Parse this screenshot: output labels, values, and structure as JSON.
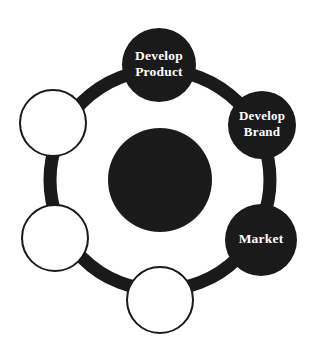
{
  "diagram": {
    "type": "cycle-wheel",
    "background_color": "#ffffff",
    "ring": {
      "name": "cycle-ring",
      "center_x": 160,
      "center_y": 180,
      "radius": 110,
      "stroke_width": 13,
      "color": "#1a1a1a"
    },
    "hub": {
      "name": "center-hub",
      "center_x": 160,
      "center_y": 180,
      "radius": 52,
      "fill": "#1a1a1a",
      "label": ""
    },
    "filled_color": "#1a1a1a",
    "empty_fill": "#ffffff",
    "empty_stroke": "#1a1a1a",
    "label_color": "#ffffff",
    "nodes": [
      {
        "id": "node-develop-product",
        "name": "node-develop-product",
        "label_lines": [
          "Develop",
          "Product"
        ],
        "filled": true,
        "cx": 159,
        "cy": 65,
        "r": 37,
        "font_size": 13.5,
        "line_height": 16
      },
      {
        "id": "node-develop-brand",
        "name": "node-develop-brand",
        "label_lines": [
          "Develop",
          "Brand"
        ],
        "filled": true,
        "cx": 262,
        "cy": 125,
        "r": 34,
        "font_size": 13,
        "line_height": 16
      },
      {
        "id": "node-market",
        "name": "node-market",
        "label_lines": [
          "Market"
        ],
        "filled": true,
        "cx": 261,
        "cy": 240,
        "r": 36,
        "font_size": 13.5,
        "line_height": 16
      },
      {
        "id": "node-bottom-empty",
        "name": "node-empty-bottom",
        "label_lines": [],
        "filled": false,
        "cx": 160,
        "cy": 300,
        "r": 33,
        "font_size": 13,
        "line_height": 16
      },
      {
        "id": "node-lower-left-empty",
        "name": "node-empty-lower-left",
        "label_lines": [],
        "filled": false,
        "cx": 55,
        "cy": 238,
        "r": 33,
        "font_size": 13,
        "line_height": 16
      },
      {
        "id": "node-upper-left-empty",
        "name": "node-empty-upper-left",
        "label_lines": [],
        "filled": false,
        "cx": 53,
        "cy": 123,
        "r": 33,
        "font_size": 13,
        "line_height": 16
      }
    ]
  }
}
